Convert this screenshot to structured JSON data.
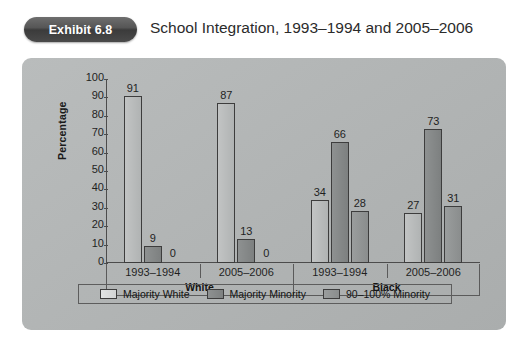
{
  "header": {
    "badge_label": "Exhibit 6.8",
    "title": "School Integration, 1993–1994 and 2005–2006"
  },
  "chart_data": {
    "type": "bar",
    "title": "School Integration, 1993–1994 and 2005–2006",
    "xlabel": "",
    "ylabel": "Percentage",
    "ylim": [
      0,
      100
    ],
    "ytick_labels": [
      "100",
      "90",
      "80",
      "70",
      "60",
      "50",
      "40",
      "30",
      "20",
      "10",
      "0"
    ],
    "ytick_values": [
      100,
      90,
      80,
      70,
      60,
      50,
      40,
      30,
      20,
      10,
      0
    ],
    "grid": false,
    "legend_position": "bottom",
    "groups": [
      "White",
      "Black"
    ],
    "categories": [
      "1993–1994",
      "2005–2006",
      "1993–1994",
      "2005–2006"
    ],
    "category_groups": [
      "White",
      "White",
      "Black",
      "Black"
    ],
    "series": [
      {
        "name": "Majority White",
        "color": "#bcbfbf",
        "values": [
          91,
          87,
          34,
          27
        ]
      },
      {
        "name": "Majority Minority",
        "color": "#868989",
        "values": [
          9,
          13,
          66,
          73
        ]
      },
      {
        "name": "90–100% Minority",
        "color": "#929595",
        "values": [
          0,
          0,
          28,
          31
        ]
      }
    ]
  },
  "legend": {
    "items": [
      {
        "label": "Majority White"
      },
      {
        "label": "Majority Minority"
      },
      {
        "label": "90–100% Minority"
      }
    ]
  }
}
